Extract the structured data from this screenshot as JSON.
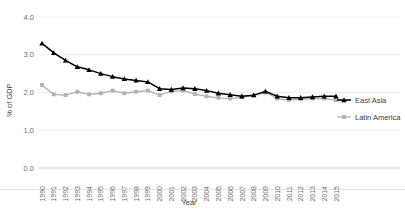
{
  "chart_data": {
    "type": "line",
    "title": "",
    "subtitle": "",
    "xlabel": "Year",
    "ylabel": "% of GDP",
    "x": [
      1990,
      1991,
      1992,
      1993,
      1994,
      1995,
      1996,
      1997,
      1998,
      1999,
      2000,
      2001,
      2002,
      2003,
      2004,
      2005,
      2006,
      2007,
      2008,
      2009,
      2010,
      2011,
      2012,
      2013,
      2014,
      2015
    ],
    "categories": [
      "1990",
      "1991",
      "1992",
      "1993",
      "1994",
      "1995",
      "1996",
      "1997",
      "1998",
      "1999",
      "2000",
      "2001",
      "2002",
      "2003",
      "2004",
      "2005",
      "2006",
      "2007",
      "2008",
      "2009",
      "2010",
      "2011",
      "2012",
      "2013",
      "2014",
      "2015"
    ],
    "ylim": [
      0.0,
      4.0
    ],
    "yticks": [
      0.0,
      1.0,
      2.0,
      3.0,
      4.0
    ],
    "yticklabels": [
      "0.0",
      "1.0",
      "2.0",
      "3.0",
      "4.0"
    ],
    "grid": true,
    "legend_position": "right",
    "series": [
      {
        "name": "East Asia",
        "color": "#000000",
        "marker": "triangle",
        "values": [
          3.3,
          3.05,
          2.85,
          2.68,
          2.6,
          2.5,
          2.42,
          2.36,
          2.32,
          2.28,
          2.1,
          2.08,
          2.12,
          2.1,
          2.05,
          1.98,
          1.94,
          1.9,
          1.93,
          2.03,
          1.9,
          1.86,
          1.86,
          1.88,
          1.9,
          1.9
        ]
      },
      {
        "name": "Latin America",
        "color": "#b0b0b0",
        "marker": "square",
        "values": [
          2.2,
          1.95,
          1.93,
          2.02,
          1.95,
          1.98,
          2.05,
          1.98,
          2.02,
          2.05,
          1.93,
          2.03,
          2.05,
          1.96,
          1.9,
          1.86,
          1.84,
          1.88,
          1.92,
          2.0,
          1.84,
          1.8,
          1.82,
          1.84,
          1.84,
          1.8
        ]
      }
    ],
    "legend": [
      {
        "label": "East Asia",
        "color": "#000000",
        "marker": "triangle"
      },
      {
        "label": "Latin America",
        "color": "#b0b0b0",
        "marker": "square"
      }
    ]
  }
}
